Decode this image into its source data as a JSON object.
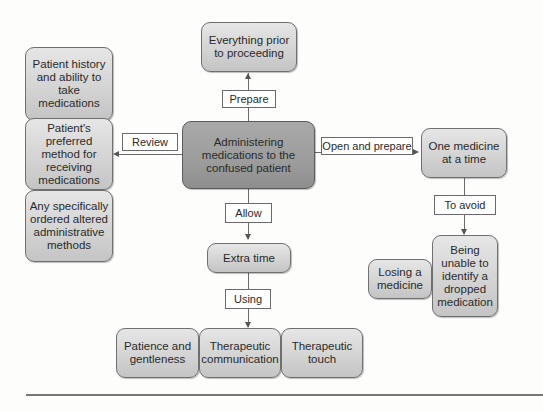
{
  "diagram": {
    "center": "Administering medications to the confused patient",
    "top": {
      "edge_label": "Prepare",
      "node": "Everything prior to proceeding"
    },
    "left": {
      "edge_label": "Review",
      "nodes": [
        "Patient history and ability to take medications",
        "Patient's preferred method for receiving medications",
        "Any specifically ordered altered administrative methods"
      ]
    },
    "right": {
      "edge_label": "Open and prepare",
      "node": "One medicine at a time",
      "sub_edge_label": "To avoid",
      "avoid_nodes": [
        "Losing a medicine",
        "Being unable to identify a dropped medication"
      ]
    },
    "bottom": {
      "edge_label": "Allow",
      "node": "Extra time",
      "sub_edge_label": "Using",
      "using_nodes": [
        "Patience and gentleness",
        "Therapeutic communication",
        "Therapeutic touch"
      ]
    }
  },
  "colors": {
    "center_fill": "#9c9c9c",
    "node_fill": "#d2d2d2",
    "border": "#6f6f6f",
    "label_fill": "#ffffff"
  }
}
